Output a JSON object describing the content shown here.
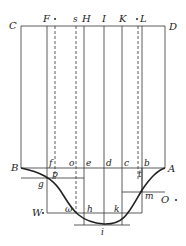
{
  "diagram": {
    "top_labels": {
      "C": "C",
      "F": "F",
      "s": "s",
      "H": "H",
      "I": "I",
      "K": "K",
      "L": "L",
      "D": "D"
    },
    "axis_labels": {
      "B": "B",
      "f": "f",
      "o": "o",
      "e": "e",
      "d": "d",
      "c": "c",
      "b": "b",
      "A": "A"
    },
    "curve_labels": {
      "p": "p",
      "g": "g",
      "t": "t",
      "m": "m",
      "O": "O",
      "W": "W",
      "omega": "ω",
      "h": "h",
      "k": "k",
      "i": "i"
    },
    "colors": {
      "line": "#333333",
      "curve": "#222222"
    }
  }
}
